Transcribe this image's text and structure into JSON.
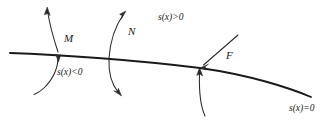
{
  "figure": {
    "type": "mathematical-diagram",
    "background_color": "#ffffff",
    "stroke_color": "#1a1a1a",
    "width": 334,
    "height": 129
  },
  "labels": {
    "point_m": "M",
    "point_n": "N",
    "point_f": "F",
    "sign_positive": "s(x)>0",
    "sign_negative": "s(x)<0",
    "sign_zero": "s(x)=0"
  },
  "curves": {
    "main_curve_name": "zero-level-curve",
    "m_curve_name": "trajectory-through-M",
    "n_curve_name": "trajectory-through-N",
    "f_branch_name": "incoming-ray-at-F",
    "f_drop_name": "descending-curve-at-F"
  }
}
